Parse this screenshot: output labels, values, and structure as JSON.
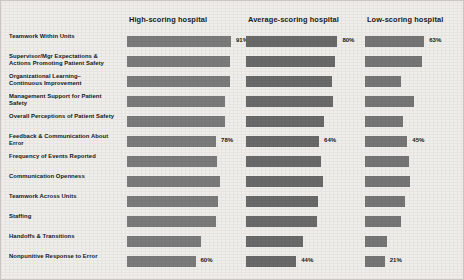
{
  "chart_data": {
    "type": "bar",
    "title": "",
    "xlabel": "",
    "ylabel": "",
    "xlim": [
      0,
      100
    ],
    "grid": false,
    "legend_position": "top",
    "orientation": "horizontal",
    "value_suffix": "%",
    "categories": [
      "Teamwork Within Units",
      "Supervisor/Mgr Expectations & Actions Promoting Patient Safety",
      "Organizational Learning–Continuous Improvement",
      "Management Support for Patient Safety",
      "Overall Perceptions of Patient Safety",
      "Feedback & Communication About Error",
      "Frequency of Events Reported",
      "Communication Openness",
      "Teamwork Across Units",
      "Staffing",
      "Handoffs & Transitions",
      "Nonpunitive Response to Error"
    ],
    "category_lines": [
      [
        "Teamwork Within Units",
        ""
      ],
      [
        "Supervisor/Mgr Expectations &",
        "Actions Promoting Patient Safety"
      ],
      [
        "Organizational Learning–",
        "Continuous Improvement"
      ],
      [
        "Management Support for Patient",
        "Safety"
      ],
      [
        "Overall Perceptions of Patient Safety",
        ""
      ],
      [
        "Feedback & Communication About",
        "Error"
      ],
      [
        "Frequency of Events Reported",
        ""
      ],
      [
        "Communication Openness",
        ""
      ],
      [
        "Teamwork Across Units",
        ""
      ],
      [
        "Staffing",
        ""
      ],
      [
        "Handoffs & Transitions",
        ""
      ],
      [
        "Nonpunitive Response to Error",
        ""
      ]
    ],
    "series": [
      {
        "name": "High-scoring hospital",
        "values": [
          91,
          90,
          90,
          86,
          86,
          78,
          79,
          81,
          80,
          78,
          65,
          60
        ],
        "labeled": [
          true,
          false,
          false,
          false,
          false,
          true,
          false,
          false,
          false,
          false,
          false,
          true
        ]
      },
      {
        "name": "Average-scoring hospital",
        "values": [
          80,
          78,
          75,
          76,
          68,
          64,
          66,
          67,
          63,
          62,
          50,
          44
        ],
        "labeled": [
          true,
          false,
          false,
          false,
          false,
          true,
          false,
          false,
          false,
          false,
          false,
          true
        ]
      },
      {
        "name": "Low-scoring hospital",
        "values": [
          63,
          61,
          38,
          52,
          40,
          45,
          47,
          48,
          43,
          38,
          23,
          21
        ],
        "labeled": [
          true,
          false,
          false,
          false,
          false,
          true,
          false,
          false,
          false,
          false,
          false,
          true
        ]
      }
    ]
  },
  "colors": {
    "background": "#efeeea",
    "bar": "#7b7b7b",
    "bar_dark": "#6a6a6a",
    "text": "#15181c"
  }
}
